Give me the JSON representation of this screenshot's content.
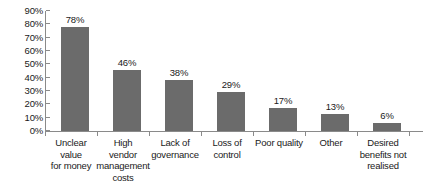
{
  "chart_data": {
    "type": "bar",
    "title": "",
    "subtitle": "",
    "xlabel": "",
    "ylabel": "",
    "ylim": [
      0,
      90
    ],
    "grid": false,
    "legend": "none",
    "orientation": "vertical",
    "bar_color": "#6b6b6b",
    "axis_color": "#8a8a8a",
    "background_color": "#ffffff",
    "value_suffix": "%",
    "categories": [
      "Unclear value for money",
      "High vendor management costs",
      "Lack of governance",
      "Loss of control",
      "Poor quality",
      "Other",
      "Desired benefits not realised"
    ],
    "category_lines": [
      [
        "Unclear",
        "value",
        "for money"
      ],
      [
        "High",
        "vendor",
        "management",
        "costs"
      ],
      [
        "Lack of",
        "governance"
      ],
      [
        "Loss of",
        "control"
      ],
      [
        "Poor quality"
      ],
      [
        "Other"
      ],
      [
        "Desired",
        "benefits not",
        "realised"
      ]
    ],
    "values": [
      78,
      46,
      38,
      29,
      17,
      13,
      6
    ],
    "value_labels": [
      "78%",
      "46%",
      "38%",
      "29%",
      "17%",
      "13%",
      "6%"
    ],
    "ytick_values": [
      0,
      10,
      20,
      30,
      40,
      50,
      60,
      70,
      80,
      90
    ],
    "ytick_labels": [
      "0%",
      "10%",
      "20%",
      "30%",
      "40%",
      "50%",
      "60%",
      "70%",
      "80%",
      "90%"
    ]
  }
}
